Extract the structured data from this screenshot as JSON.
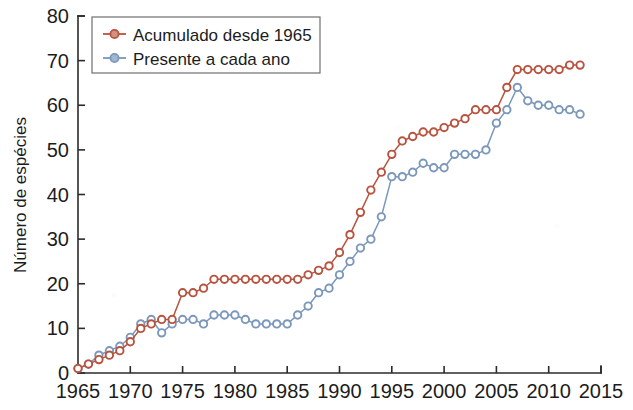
{
  "chart_data": {
    "type": "line",
    "title": "",
    "subtitle": "",
    "xlabel": "",
    "ylabel": "Número de espécies",
    "xlim": [
      1965,
      2015
    ],
    "ylim": [
      0,
      80
    ],
    "xticks": [
      1965,
      1970,
      1975,
      1980,
      1985,
      1990,
      1995,
      2000,
      2005,
      2010,
      2015
    ],
    "yticks": [
      0,
      10,
      20,
      30,
      40,
      50,
      60,
      70,
      80
    ],
    "grid": false,
    "legend_position": "top-left",
    "annotations": [],
    "colors": {
      "accumulated": "#b8533f",
      "present": "#7b97bb",
      "axis": "#2b2b2b",
      "background": "#ffffff",
      "legend_border": "#6e6e6e"
    },
    "x": [
      1965,
      1966,
      1967,
      1968,
      1969,
      1970,
      1971,
      1972,
      1973,
      1974,
      1975,
      1976,
      1977,
      1978,
      1979,
      1980,
      1981,
      1982,
      1983,
      1984,
      1985,
      1986,
      1987,
      1988,
      1989,
      1990,
      1991,
      1992,
      1993,
      1994,
      1995,
      1996,
      1997,
      1998,
      1999,
      2000,
      2001,
      2002,
      2003,
      2004,
      2005,
      2006,
      2007,
      2008,
      2009,
      2010,
      2011,
      2012,
      2013
    ],
    "series": [
      {
        "name": "Acumulado desde 1965",
        "color": "#b8533f",
        "marker": "circle-open",
        "values": [
          1,
          2,
          3,
          4,
          5,
          7,
          10,
          11,
          12,
          12,
          18,
          18,
          19,
          21,
          21,
          21,
          21,
          21,
          21,
          21,
          21,
          21,
          22,
          23,
          24,
          27,
          31,
          36,
          41,
          45,
          49,
          52,
          53,
          54,
          54,
          55,
          56,
          57,
          59,
          59,
          59,
          64,
          68,
          68,
          68,
          68,
          68,
          69,
          69
        ]
      },
      {
        "name": "Presente a cada ano",
        "color": "#7b97bb",
        "marker": "circle-open",
        "values": [
          1,
          2,
          4,
          5,
          6,
          8,
          11,
          12,
          9,
          11,
          12,
          12,
          11,
          13,
          13,
          13,
          12,
          11,
          11,
          11,
          11,
          13,
          15,
          18,
          19,
          22,
          25,
          28,
          30,
          35,
          44,
          44,
          45,
          47,
          46,
          46,
          49,
          49,
          49,
          50,
          56,
          59,
          64,
          61,
          60,
          60,
          59,
          59,
          58
        ]
      }
    ]
  },
  "legend": {
    "entries": [
      {
        "label": "Acumulado desde 1965",
        "color": "#b8533f"
      },
      {
        "label": "Presente a cada ano",
        "color": "#7b97bb"
      }
    ]
  },
  "axes": {
    "y_title": "Número de espécies",
    "x_tick_labels": [
      "1965",
      "1970",
      "1975",
      "1980",
      "1985",
      "1990",
      "1995",
      "2000",
      "2005",
      "2010",
      "2015"
    ],
    "y_tick_labels": [
      "0",
      "10",
      "20",
      "30",
      "40",
      "50",
      "60",
      "70",
      "80"
    ]
  }
}
